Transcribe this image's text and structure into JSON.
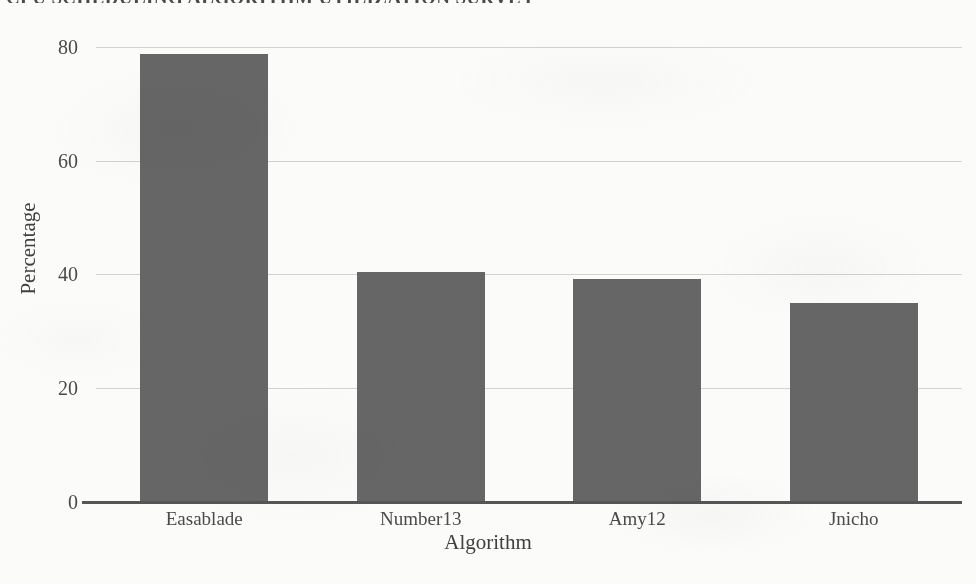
{
  "chart_data": {
    "type": "bar",
    "title": "CPU SCHEDULING ALGORITHM UTILIZATION SURVEY",
    "xlabel": "Algorithm",
    "ylabel": "Percentage",
    "categories": [
      "Easablade",
      "Number13",
      "Amy12",
      "Jnicho"
    ],
    "values": [
      78.8,
      40.4,
      39.2,
      35.0
    ],
    "yticks": [
      0,
      20,
      40,
      60,
      80
    ],
    "ytick_labels": [
      "0",
      "20",
      "40",
      "60",
      "80"
    ],
    "ylim": [
      0,
      84
    ],
    "grid": true,
    "legend": false,
    "legend_position": "none",
    "bar_color": "#666666",
    "gridline_color": "#d2d2d2",
    "axis_color": "#555555",
    "text_color": "#4a4a4a",
    "background_color": "#fbfbfa"
  }
}
